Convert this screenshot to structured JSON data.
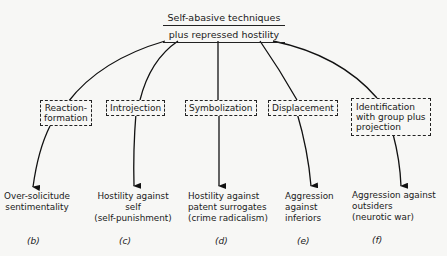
{
  "root": {
    "line1": "Self-abasive techniques",
    "line2": "plus repressed hostility"
  },
  "mechanisms": [
    {
      "line1": "Reaction-",
      "line2": "formation"
    },
    {
      "line1": "Introjection"
    },
    {
      "line1": "Symbolization"
    },
    {
      "line1": "Displacement"
    },
    {
      "line1": "Identification",
      "line2": "with group plus",
      "line3": "projection"
    }
  ],
  "outcomes": [
    {
      "line1": "Over-solicitude",
      "line2": "sentimentality"
    },
    {
      "line1": "Hostility against",
      "line2": "self",
      "line3": "(self-punishment)"
    },
    {
      "line1": "Hostility against",
      "line2": "patent surrogates",
      "line3": "(crime radicalism)"
    },
    {
      "line1": "Aggression",
      "line2": "against",
      "line3": "inferiors"
    },
    {
      "line1": "Aggression against",
      "line2": "outsiders",
      "line3": "(neurotic war)"
    }
  ],
  "labels": [
    "(b)",
    "(c)",
    "(d)",
    "(e)",
    "(f)"
  ]
}
